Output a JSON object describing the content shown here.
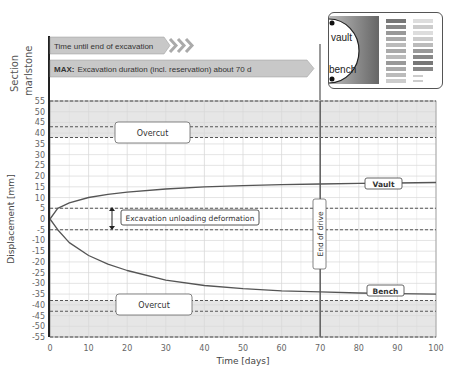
{
  "section": {
    "label_line1": "Section",
    "label_line2": "marlstone"
  },
  "timeline": {
    "bar1_text": "Time until end of excavation",
    "bar2_prefix": "MAX:",
    "bar2_text": "Excavation duration (incl. reservation) about 70 d"
  },
  "inset": {
    "vault_label": "vault",
    "bench_label": "bench"
  },
  "annotations": {
    "overcut_top": "Overcut",
    "overcut_bottom": "Overcut",
    "unloading": "Excavation unloading deformation",
    "end_of_drive": "End of drive",
    "vault_label": "Vault",
    "bench_label": "Bench"
  },
  "colors": {
    "curve": "#555555",
    "overcut_fill": "#e6e6e6",
    "grid": "#d9d9d9",
    "axis": "#222222",
    "bar_fill": "#c8c8c8"
  },
  "chart_data": {
    "type": "line",
    "title": "",
    "xlabel": "Time [days]",
    "ylabel": "Displacement [mm]",
    "xlim": [
      0,
      100
    ],
    "ylim": [
      -55,
      55
    ],
    "x_ticks": [
      0,
      10,
      20,
      30,
      40,
      50,
      60,
      70,
      80,
      90,
      100
    ],
    "y_ticks": [
      55,
      50,
      45,
      40,
      35,
      30,
      25,
      20,
      15,
      10,
      5,
      0,
      -5,
      -10,
      -15,
      -20,
      -25,
      -30,
      -35,
      -40,
      -45,
      -50,
      -55
    ],
    "grid": true,
    "series": [
      {
        "name": "Vault",
        "x": [
          0,
          2,
          5,
          10,
          15,
          20,
          30,
          40,
          50,
          60,
          70,
          80,
          90,
          100
        ],
        "values": [
          0,
          5,
          7.5,
          10,
          11.5,
          12.5,
          14,
          15,
          15.5,
          16,
          16.3,
          16.6,
          16.8,
          17
        ]
      },
      {
        "name": "Bench",
        "x": [
          0,
          2,
          5,
          10,
          15,
          20,
          30,
          40,
          50,
          60,
          70,
          80,
          90,
          100
        ],
        "values": [
          0,
          -5,
          -11,
          -17,
          -21,
          -24,
          -28.5,
          -31,
          -32.5,
          -33.5,
          -34,
          -34.5,
          -34.8,
          -35
        ]
      }
    ],
    "reference_lines": {
      "horizontal_dashed": [
        55,
        43,
        38,
        5,
        -5,
        -38,
        -43,
        -55
      ],
      "vertical": [
        70
      ]
    },
    "bands": [
      {
        "name": "Overcut",
        "from": 38,
        "to": 55
      },
      {
        "name": "Overcut",
        "from": -55,
        "to": -38
      }
    ],
    "annotations": [
      "Overcut",
      "Overcut",
      "Excavation unloading deformation",
      "End of drive",
      "Vault",
      "Bench"
    ]
  }
}
